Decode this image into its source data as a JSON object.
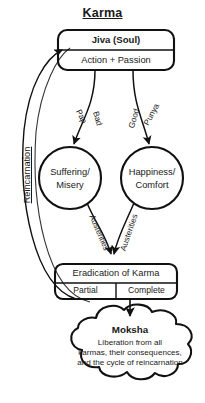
{
  "diagram": {
    "title": "Karma",
    "nodes": {
      "jiva": {
        "head": "Jiva (Soul)",
        "sub": "Action + Passion"
      },
      "suffering": {
        "line1": "Suffering/",
        "line2": "Misery"
      },
      "happiness": {
        "line1": "Happiness/",
        "line2": "Comfort"
      },
      "eradication": {
        "head": "Eradication of Karma",
        "left_cell": "Partial",
        "right_cell": "Complete"
      },
      "moksha": {
        "head": "Moksha",
        "line1": "Liberation from all",
        "line2": "karmas, their consequences,",
        "line3": "and the cycle of reincarnation"
      }
    },
    "edges": {
      "pap": "Pap",
      "bad": "Bad",
      "punya": "Punya",
      "good": "Good",
      "austerities_left": "Austerities",
      "austerities_right": "Austerities",
      "reincarnation": "Reincarnation"
    },
    "colors": {
      "stroke": "#111111",
      "text": "#1a1a1a",
      "background": "#ffffff"
    }
  }
}
